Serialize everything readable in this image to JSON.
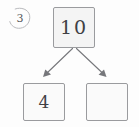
{
  "worksheet": {
    "question_number": "3",
    "problem_type": "number-bond",
    "whole": {
      "label": "10",
      "filled": true
    },
    "parts": [
      {
        "label": "4",
        "filled": true
      },
      {
        "label": "",
        "filled": false
      }
    ],
    "connectors": [
      {
        "from": "whole",
        "to": "part-left",
        "direction": "down-left"
      },
      {
        "from": "whole",
        "to": "part-right",
        "direction": "down-right"
      }
    ]
  },
  "colors": {
    "page_background": "#fdfdfd",
    "box_border": "#9a9b9e",
    "box_fill": "#fafafa",
    "whole_box_fill": "#f4f4f4",
    "ink": "#3f4044",
    "question_ink": "#55565a",
    "arrow": "#76777b"
  }
}
